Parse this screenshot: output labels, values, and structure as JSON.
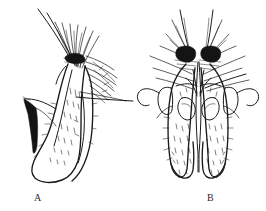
{
  "plate": {
    "kind": "scientific-line-drawing",
    "background_color": "#ffffff",
    "ink_color": "#1a1a1a",
    "width": 266,
    "height": 211,
    "subject": "comparative morphology line drawings, two views",
    "panels": [
      {
        "id": "A",
        "label": "A",
        "label_x": 38,
        "label_y": 198,
        "description": "lateral view of a single elongate lobe bearing a dense apical cluster of long setae and a dark basal spine",
        "features": [
          "apical setal tuft",
          "marginal row of short setae",
          "dark basal triangular spine",
          "internal stippling"
        ]
      },
      {
        "id": "B",
        "label": "B",
        "label_x": 211,
        "label_y": 198,
        "description": "ventral view of paired symmetric lobes with two dense apical setal patches and lateral hook-shaped appendages",
        "features": [
          "paired apical setal patches",
          "lateral curved hook appendages",
          "median longitudinal sclerite",
          "paired inner pockets",
          "stippled surface"
        ]
      }
    ]
  },
  "figure_labels": {
    "a": "A",
    "b": "B"
  }
}
